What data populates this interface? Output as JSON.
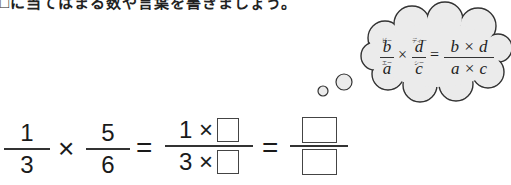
{
  "instruction": "□に当てはまる数や言葉を書きましょう。",
  "thought_bubble": {
    "formula": {
      "left_fraction": {
        "numerator": "b",
        "numerator_ruby": "ビー",
        "denominator": "a",
        "denominator_ruby": "エー"
      },
      "operator": "×",
      "right_fraction": {
        "numerator": "d",
        "numerator_ruby": "ディー",
        "denominator": "c",
        "denominator_ruby": "シー"
      },
      "equals": "=",
      "result": {
        "numerator": "b × d",
        "denominator": "a × c"
      }
    }
  },
  "equation": {
    "fraction1": {
      "numerator": "1",
      "denominator": "3"
    },
    "times": "×",
    "fraction2": {
      "numerator": "5",
      "denominator": "6"
    },
    "equals1": "=",
    "fraction3": {
      "numerator_text": "1 ×",
      "denominator_text": "3 ×",
      "numerator_blank": "",
      "denominator_blank": ""
    },
    "equals2": "=",
    "fraction4": {
      "numerator_blank": "",
      "denominator_blank": ""
    }
  },
  "colors": {
    "bubble_fill": "#ebebeb",
    "bubble_stroke": "#333333",
    "text": "#1a1a1a"
  }
}
